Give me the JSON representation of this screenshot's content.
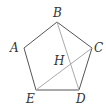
{
  "diagram": {
    "colors": {
      "edge": "#555555",
      "diagonal": "#aaaaaa",
      "label": "#333333",
      "background": "#ffffff"
    },
    "vertices": {
      "A": {
        "label": "A",
        "x": 24,
        "y": 48
      },
      "B": {
        "label": "B",
        "x": 57,
        "y": 22
      },
      "C": {
        "label": "C",
        "x": 92,
        "y": 48
      },
      "D": {
        "label": "D",
        "x": 79,
        "y": 90
      },
      "E": {
        "label": "E",
        "x": 36,
        "y": 90
      }
    },
    "intersection": {
      "label": "H",
      "x": 72,
      "y": 64
    },
    "edges": [
      "AB",
      "BC",
      "CD",
      "DE",
      "EA"
    ],
    "diagonals": [
      "BD",
      "CE"
    ],
    "labels": {
      "A": "A",
      "B": "B",
      "C": "C",
      "D": "D",
      "E": "E",
      "H": "H"
    }
  }
}
